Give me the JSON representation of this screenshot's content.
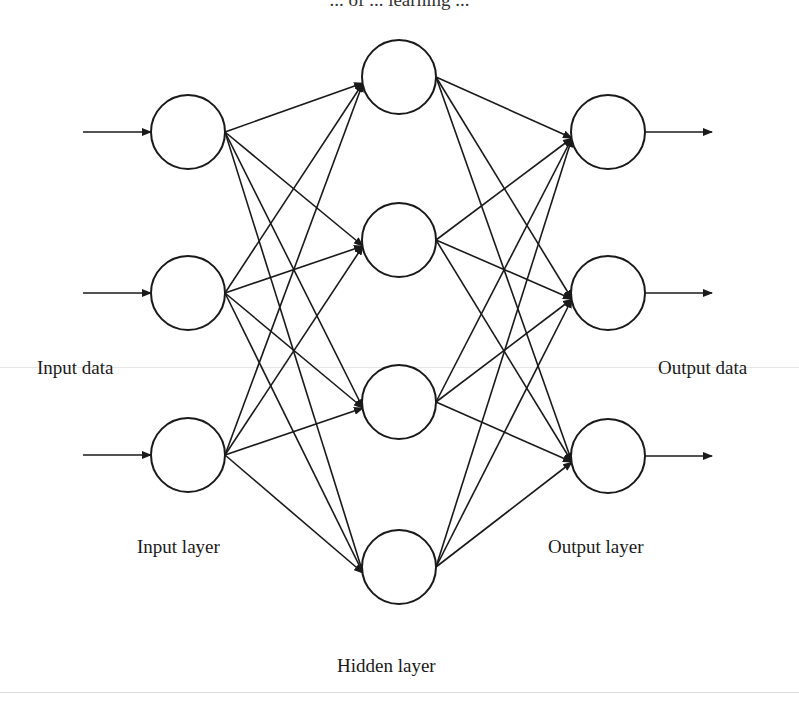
{
  "title": "... of ... learning ...",
  "labels": {
    "input_data": "Input data",
    "output_data": "Output data",
    "input_layer": "Input layer",
    "hidden_layer": "Hidden layer",
    "output_layer": "Output layer"
  },
  "network": {
    "layers": [
      {
        "name": "input",
        "nodes": 3
      },
      {
        "name": "hidden",
        "nodes": 4
      },
      {
        "name": "output",
        "nodes": 3
      }
    ],
    "connectivity": "fully-connected",
    "input_arrows": 3,
    "output_arrows": 3
  },
  "colors": {
    "stroke": "#1a1a1a",
    "background": "#ffffff"
  }
}
